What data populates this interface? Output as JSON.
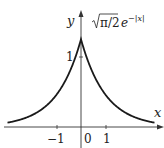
{
  "chart_data": {
    "type": "line",
    "title": "",
    "formula_label": {
      "sqrt_part": "π/2",
      "exp_base": "e",
      "exp_power": "−|x|"
    },
    "function": "sqrt(pi/2) * exp(-|x|)",
    "xlabel": "x",
    "ylabel": "y",
    "x_ticks": [
      {
        "value": -1,
        "label": "−1"
      },
      {
        "value": 0,
        "label": "0"
      },
      {
        "value": 1,
        "label": "1"
      }
    ],
    "y_ticks": [
      {
        "value": 1,
        "label": "1"
      }
    ],
    "xlim": [
      -3,
      3
    ],
    "ylim": [
      0,
      1.45
    ],
    "peak": {
      "x": 0,
      "y": 1.2533
    },
    "series": [
      {
        "name": "sqrt(pi/2) e^{-|x|}",
        "x": [
          -3,
          -2.5,
          -2,
          -1.5,
          -1,
          -0.5,
          0,
          0.5,
          1,
          1.5,
          2,
          2.5,
          3
        ],
        "values": [
          0.062,
          0.103,
          0.17,
          0.28,
          0.461,
          0.76,
          1.253,
          0.76,
          0.461,
          0.28,
          0.17,
          0.103,
          0.062
        ]
      }
    ],
    "grid": false,
    "legend": "none",
    "colors": {
      "line": "#1a1a1a",
      "axis": "#333333"
    }
  }
}
